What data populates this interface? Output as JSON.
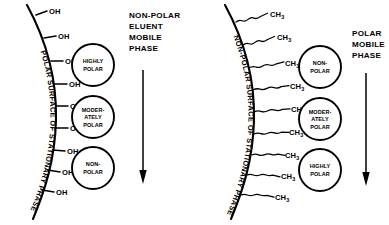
{
  "figure": {
    "background_color": "#ffffff",
    "ink_color": "#000000",
    "panels": [
      {
        "id": "normal-phase",
        "surface_label": "POLAR SURFACE OF STATIONARY PHASE",
        "group_label": "OH",
        "group_label_subscript": "",
        "group_count": 9,
        "chain_style": "none",
        "mobile_phase_header_lines": [
          "NON-POLAR",
          "ELUENT",
          "MOBILE",
          "PHASE"
        ],
        "arrow_direction": "down",
        "analyte_circles": [
          {
            "lines": [
              "HIGHLY",
              "POLAR"
            ]
          },
          {
            "lines": [
              "MODER-",
              "ATELY",
              "POLAR"
            ]
          },
          {
            "lines": [
              "NON-",
              "POLAR"
            ]
          }
        ]
      },
      {
        "id": "reversed-phase",
        "surface_label": "NON-POLAR SURFACE OF STATIONARY PHASE",
        "group_label": "CH",
        "group_label_subscript": "3",
        "group_count": 9,
        "chain_style": "wavy",
        "mobile_phase_header_lines": [
          "POLAR",
          "MOBILE",
          "PHASE"
        ],
        "arrow_direction": "down",
        "analyte_circles": [
          {
            "lines": [
              "NON-",
              "POLAR"
            ]
          },
          {
            "lines": [
              "MODER-",
              "ATELY",
              "POLAR"
            ]
          },
          {
            "lines": [
              "HIGHLY",
              "POLAR"
            ]
          }
        ]
      }
    ]
  }
}
